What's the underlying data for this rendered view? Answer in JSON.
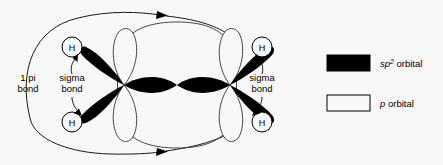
{
  "figure": {
    "background_color": "#f8f8f8",
    "line_color": "#000000",
    "fill_color": "#000000"
  },
  "molecule": {
    "atoms": [
      {
        "id": "h-top-left",
        "label": "H",
        "x": 72,
        "y": 47
      },
      {
        "id": "h-bottom-left",
        "label": "H",
        "x": 72,
        "y": 122
      },
      {
        "id": "h-top-right",
        "label": "H",
        "x": 262,
        "y": 47
      },
      {
        "id": "h-bottom-right",
        "label": "H",
        "x": 262,
        "y": 122
      }
    ],
    "carbon_centers": [
      {
        "id": "carbon-left",
        "x": 124,
        "y": 85
      },
      {
        "id": "carbon-right",
        "x": 230,
        "y": 85
      }
    ]
  },
  "labels": {
    "pi_bond": {
      "line1": "1 pi",
      "line2": "bond"
    },
    "sigma_bond_left": {
      "line1": "sigma",
      "line2": "bond"
    },
    "sigma_bond_right": {
      "line1": "sigma",
      "line2": "bond"
    }
  },
  "legend": {
    "items": [
      {
        "id": "sp2-orbital",
        "swatch": "filled",
        "symbol": "sp",
        "superscript": "2",
        "text": " orbital"
      },
      {
        "id": "p-orbital",
        "swatch": "outline",
        "symbol": "p",
        "superscript": "",
        "text": " orbital"
      }
    ]
  }
}
